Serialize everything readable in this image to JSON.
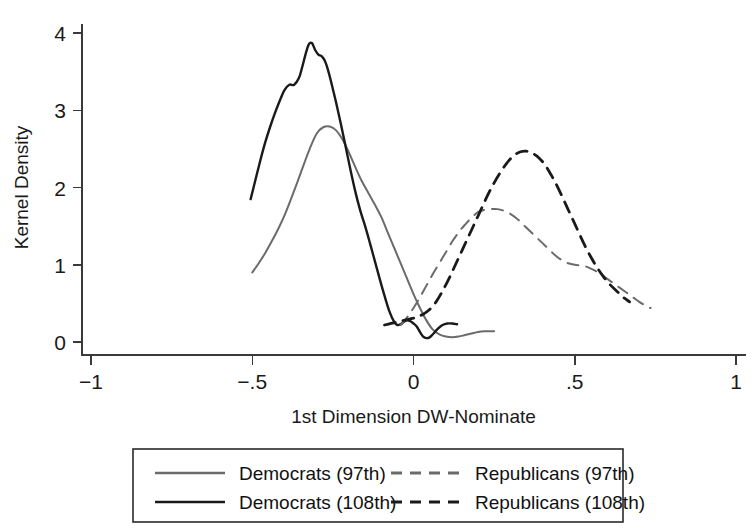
{
  "chart_data": {
    "type": "line",
    "title": "",
    "xlabel": "1st Dimension DW-Nominate",
    "ylabel": "Kernel Density",
    "xlim": [
      -1,
      1
    ],
    "ylim": [
      0,
      4.25
    ],
    "grid": false,
    "legend_position": "below",
    "xticks": [
      -1,
      -0.5,
      0,
      0.5,
      1
    ],
    "xticklabels": [
      "-1",
      "-.5",
      "0",
      ".5",
      "1"
    ],
    "yticks": [
      0,
      1,
      2,
      3,
      4
    ],
    "yticklabels": [
      "0",
      "1",
      "2",
      "3",
      "4"
    ],
    "series": [
      {
        "name": "Democrats (97th)",
        "style": "solid",
        "color": "#6b6b6b",
        "width": 2.0,
        "x": [
          -0.5,
          -0.48,
          -0.46,
          -0.44,
          -0.42,
          -0.4,
          -0.38,
          -0.36,
          -0.34,
          -0.32,
          -0.3,
          -0.28,
          -0.26,
          -0.24,
          -0.22,
          -0.2,
          -0.18,
          -0.16,
          -0.14,
          -0.12,
          -0.1,
          -0.08,
          -0.06,
          -0.04,
          -0.02,
          0.0,
          0.02,
          0.04,
          0.06,
          0.08,
          0.1,
          0.12,
          0.14,
          0.16,
          0.18,
          0.2,
          0.22,
          0.24,
          0.25
        ],
        "y": [
          0.9,
          1.02,
          1.15,
          1.3,
          1.46,
          1.64,
          1.85,
          2.07,
          2.3,
          2.52,
          2.7,
          2.78,
          2.79,
          2.74,
          2.62,
          2.45,
          2.26,
          2.08,
          1.93,
          1.78,
          1.62,
          1.42,
          1.22,
          1.02,
          0.82,
          0.62,
          0.44,
          0.28,
          0.16,
          0.1,
          0.07,
          0.06,
          0.07,
          0.09,
          0.11,
          0.13,
          0.14,
          0.14,
          0.14
        ]
      },
      {
        "name": "Democrats (108th)",
        "style": "solid",
        "color": "#1a1a1a",
        "width": 2.4,
        "x": [
          -0.505,
          -0.49,
          -0.475,
          -0.46,
          -0.445,
          -0.43,
          -0.415,
          -0.4,
          -0.385,
          -0.37,
          -0.355,
          -0.345,
          -0.335,
          -0.325,
          -0.315,
          -0.305,
          -0.295,
          -0.285,
          -0.275,
          -0.265,
          -0.255,
          -0.24,
          -0.225,
          -0.21,
          -0.195,
          -0.18,
          -0.165,
          -0.15,
          -0.135,
          -0.12,
          -0.105,
          -0.09,
          -0.075,
          -0.06,
          -0.05,
          -0.04,
          -0.03,
          -0.02,
          -0.01,
          0.0,
          0.01,
          0.02,
          0.03,
          0.04,
          0.05,
          0.06,
          0.075,
          0.09,
          0.105,
          0.12,
          0.135
        ],
        "y": [
          1.85,
          2.1,
          2.35,
          2.58,
          2.78,
          2.96,
          3.12,
          3.26,
          3.33,
          3.33,
          3.42,
          3.56,
          3.72,
          3.85,
          3.87,
          3.78,
          3.72,
          3.7,
          3.64,
          3.52,
          3.36,
          3.1,
          2.82,
          2.52,
          2.22,
          1.94,
          1.7,
          1.5,
          1.28,
          1.05,
          0.82,
          0.6,
          0.4,
          0.26,
          0.22,
          0.23,
          0.26,
          0.28,
          0.27,
          0.24,
          0.2,
          0.13,
          0.07,
          0.05,
          0.06,
          0.1,
          0.17,
          0.22,
          0.24,
          0.24,
          0.23
        ]
      },
      {
        "name": "Republicans (97th)",
        "style": "dashed",
        "color": "#6b6b6b",
        "width": 2.0,
        "x": [
          -0.04,
          -0.02,
          0.0,
          0.02,
          0.04,
          0.06,
          0.08,
          0.1,
          0.12,
          0.14,
          0.16,
          0.18,
          0.2,
          0.22,
          0.24,
          0.26,
          0.28,
          0.3,
          0.32,
          0.34,
          0.36,
          0.38,
          0.4,
          0.42,
          0.44,
          0.46,
          0.48,
          0.5,
          0.52,
          0.54,
          0.56,
          0.58,
          0.6,
          0.62,
          0.64,
          0.66,
          0.68,
          0.7,
          0.72,
          0.735
        ],
        "y": [
          0.22,
          0.32,
          0.44,
          0.58,
          0.73,
          0.88,
          1.02,
          1.16,
          1.3,
          1.42,
          1.52,
          1.61,
          1.68,
          1.71,
          1.72,
          1.72,
          1.7,
          1.66,
          1.6,
          1.52,
          1.44,
          1.36,
          1.28,
          1.2,
          1.12,
          1.06,
          1.02,
          1.0,
          0.99,
          0.97,
          0.93,
          0.88,
          0.82,
          0.76,
          0.7,
          0.64,
          0.58,
          0.52,
          0.47,
          0.44
        ]
      },
      {
        "name": "Republicans (108th)",
        "style": "dashed",
        "color": "#1a1a1a",
        "width": 2.8,
        "x": [
          -0.09,
          -0.07,
          -0.05,
          -0.03,
          -0.01,
          0.01,
          0.03,
          0.05,
          0.07,
          0.09,
          0.11,
          0.13,
          0.15,
          0.17,
          0.19,
          0.21,
          0.23,
          0.25,
          0.27,
          0.29,
          0.31,
          0.33,
          0.35,
          0.37,
          0.39,
          0.41,
          0.43,
          0.45,
          0.47,
          0.49,
          0.51,
          0.53,
          0.55,
          0.57,
          0.59,
          0.61,
          0.63,
          0.65,
          0.67
        ],
        "y": [
          0.22,
          0.24,
          0.26,
          0.28,
          0.3,
          0.32,
          0.36,
          0.42,
          0.52,
          0.66,
          0.82,
          1.0,
          1.18,
          1.36,
          1.54,
          1.72,
          1.9,
          2.06,
          2.2,
          2.32,
          2.41,
          2.46,
          2.47,
          2.44,
          2.38,
          2.28,
          2.14,
          1.98,
          1.8,
          1.62,
          1.44,
          1.26,
          1.1,
          0.96,
          0.84,
          0.74,
          0.66,
          0.58,
          0.52
        ]
      }
    ]
  },
  "legend": {
    "entries": [
      {
        "label": "Democrats (97th)",
        "style": "solid",
        "color": "#6b6b6b",
        "row": 0,
        "col": 0
      },
      {
        "label": "Republicans (97th)",
        "style": "dashed",
        "color": "#6b6b6b",
        "row": 0,
        "col": 1
      },
      {
        "label": "Democrats (108th)",
        "style": "solid",
        "color": "#1a1a1a",
        "row": 1,
        "col": 0
      },
      {
        "label": "Republicans (108th)",
        "style": "dashed",
        "color": "#1a1a1a",
        "row": 1,
        "col": 1
      }
    ]
  }
}
